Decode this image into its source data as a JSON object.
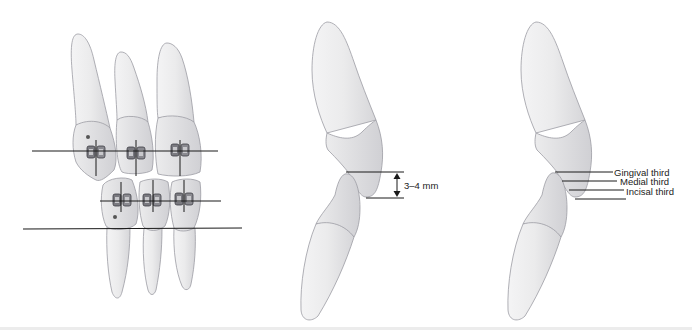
{
  "figure": {
    "panels": [
      {
        "id": "bracket-positioning",
        "description": "Frontal view of upper and lower anterior teeth with orthodontic brackets and reference lines"
      },
      {
        "id": "overbite-measurement",
        "labels": {
          "measurement": "3–4 mm"
        }
      },
      {
        "id": "crown-thirds",
        "labels": {
          "gingival": "Gingival third",
          "medial": "Medial third",
          "incisal": "Incisal third"
        }
      }
    ],
    "colors": {
      "tooth_fill": "#e9e9ea",
      "tooth_shade": "#d3d3d6",
      "outline": "#9c9ca3",
      "line": "#1a1a1a",
      "bracket": "#6b6b70"
    }
  }
}
